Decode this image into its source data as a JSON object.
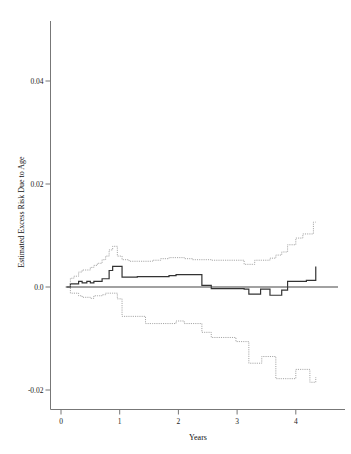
{
  "chart_data": {
    "type": "line",
    "title": "",
    "subtitle": "",
    "xlabel": "Years",
    "ylabel": "Estimated Excess Risk Due to Age",
    "xlim": [
      -0.15,
      4.75
    ],
    "ylim": [
      -0.026,
      0.052
    ],
    "xticks": [
      0,
      1,
      2,
      3,
      4
    ],
    "xtick_labels": [
      "0",
      "1",
      "2",
      "3",
      "4"
    ],
    "yticks": [
      -0.02,
      0.0,
      0.02,
      0.04
    ],
    "ytick_labels": [
      "-0.02",
      "0.0",
      "0.02",
      "0.04"
    ],
    "grid": false,
    "legend": "none",
    "annotations": [],
    "style": {
      "estimate_color": "#333333",
      "band_color": "#9a9a9a",
      "zero_line_color": "#444444",
      "axis_color": "#777777",
      "background": "#ffffff"
    },
    "series": [
      {
        "name": "Estimated excess risk due to age",
        "kind": "step",
        "linestyle": "solid",
        "color": "#333333",
        "x": [
          0.1,
          0.16,
          0.22,
          0.3,
          0.36,
          0.44,
          0.5,
          0.56,
          0.62,
          0.7,
          0.76,
          0.82,
          0.88,
          0.96,
          1.04,
          1.16,
          1.3,
          1.56,
          1.84,
          1.96,
          2.1,
          2.24,
          2.4,
          2.56,
          2.78,
          2.98,
          3.12,
          3.2,
          3.3,
          3.4,
          3.48,
          3.56,
          3.66,
          3.76,
          3.86,
          4.0,
          4.18,
          4.3,
          4.34
        ],
        "y": [
          0.0,
          0.0006,
          0.0006,
          0.0011,
          0.0008,
          0.0011,
          0.0008,
          0.0011,
          0.0011,
          0.0016,
          0.0016,
          0.0032,
          0.004,
          0.004,
          0.0019,
          0.0019,
          0.002,
          0.002,
          0.0022,
          0.0024,
          0.0024,
          0.0024,
          0.0003,
          -0.0003,
          -0.0003,
          -0.0003,
          -0.0004,
          -0.0014,
          -0.0014,
          -0.0004,
          -0.0004,
          -0.0016,
          -0.0016,
          -0.0006,
          0.0011,
          0.0011,
          0.0013,
          0.0013,
          0.004
        ]
      },
      {
        "name": "Upper confidence limit",
        "kind": "step",
        "linestyle": "dotted",
        "color": "#9a9a9a",
        "x": [
          0.1,
          0.16,
          0.22,
          0.3,
          0.36,
          0.44,
          0.5,
          0.56,
          0.62,
          0.7,
          0.76,
          0.82,
          0.88,
          0.96,
          1.04,
          1.16,
          1.3,
          1.44,
          1.56,
          1.7,
          1.84,
          1.96,
          2.1,
          2.24,
          2.4,
          2.56,
          2.78,
          2.98,
          3.12,
          3.2,
          3.3,
          3.42,
          3.56,
          3.66,
          3.76,
          3.86,
          4.0,
          4.12,
          4.24,
          4.3,
          4.34
        ],
        "y": [
          0.0,
          0.0017,
          0.0021,
          0.0029,
          0.0033,
          0.0033,
          0.0038,
          0.0042,
          0.0046,
          0.0053,
          0.006,
          0.0072,
          0.0079,
          0.006,
          0.0053,
          0.005,
          0.005,
          0.005,
          0.0052,
          0.0055,
          0.0057,
          0.0057,
          0.0055,
          0.0053,
          0.0053,
          0.0052,
          0.0052,
          0.0052,
          0.0044,
          0.0044,
          0.0052,
          0.0052,
          0.0056,
          0.0062,
          0.0068,
          0.0082,
          0.0095,
          0.0103,
          0.0103,
          0.0126,
          0.0126
        ]
      },
      {
        "name": "Lower confidence limit",
        "kind": "step",
        "linestyle": "dotted",
        "color": "#9a9a9a",
        "x": [
          0.1,
          0.16,
          0.22,
          0.3,
          0.36,
          0.44,
          0.5,
          0.56,
          0.62,
          0.7,
          0.76,
          0.82,
          0.88,
          0.96,
          1.04,
          1.16,
          1.3,
          1.44,
          1.56,
          1.7,
          1.84,
          1.96,
          2.1,
          2.24,
          2.4,
          2.56,
          2.78,
          2.98,
          3.12,
          3.2,
          3.3,
          3.42,
          3.56,
          3.66,
          3.76,
          3.86,
          4.0,
          4.12,
          4.24,
          4.3,
          4.34
        ],
        "y": [
          0.0,
          -0.0012,
          -0.0012,
          -0.0017,
          -0.002,
          -0.002,
          -0.0022,
          -0.0017,
          -0.0017,
          -0.0015,
          -0.0012,
          -0.0012,
          -0.0012,
          -0.0023,
          -0.0057,
          -0.0057,
          -0.0057,
          -0.0071,
          -0.0071,
          -0.0071,
          -0.0071,
          -0.0066,
          -0.0071,
          -0.0071,
          -0.0088,
          -0.0098,
          -0.0098,
          -0.0106,
          -0.0106,
          -0.0148,
          -0.0148,
          -0.0135,
          -0.0135,
          -0.0178,
          -0.0178,
          -0.0178,
          -0.016,
          -0.016,
          -0.0185,
          -0.0185,
          -0.0175
        ]
      },
      {
        "name": "Zero reference line",
        "kind": "hline",
        "linestyle": "solid",
        "color": "#444444",
        "x": [
          0.08,
          4.72
        ],
        "y": [
          0.0,
          0.0
        ]
      }
    ]
  }
}
